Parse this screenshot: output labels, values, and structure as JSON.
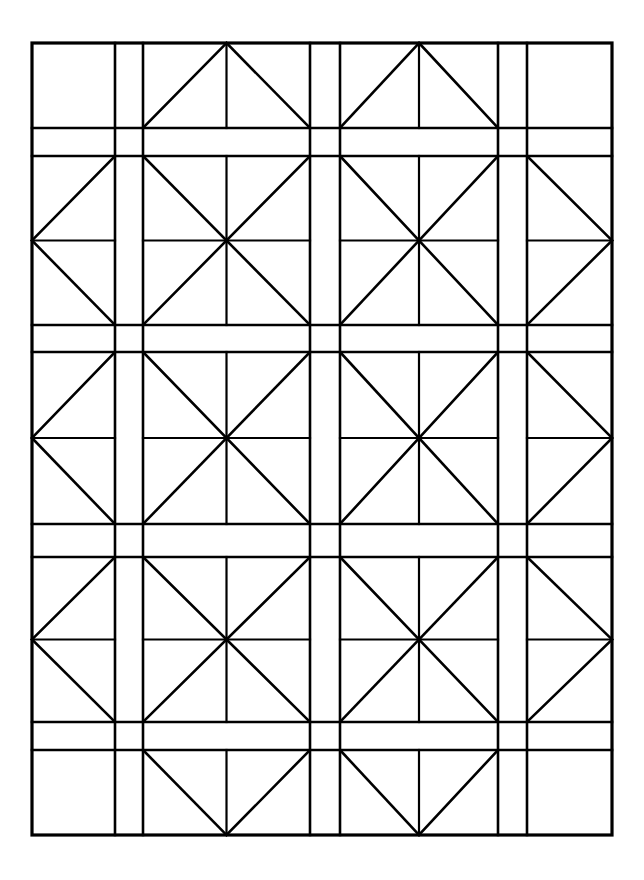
{
  "figure": {
    "background_color": "#ffffff",
    "line_color": "#000000",
    "canvas": {
      "width": 644,
      "height": 880
    }
  },
  "geometry": {
    "border": {
      "x": 32,
      "y": 43,
      "width": 580,
      "height": 792,
      "stroke_width": 3.2
    },
    "column_edges": [
      32,
      115,
      143,
      310,
      340,
      498,
      527,
      612
    ],
    "row_edges": [
      43,
      128,
      156,
      325,
      352,
      524,
      557,
      722,
      750,
      835
    ],
    "column_kinds": [
      "half",
      "sash",
      "block",
      "sash",
      "block",
      "sash",
      "half"
    ],
    "row_kinds": [
      "half",
      "sash",
      "block",
      "sash",
      "block",
      "sash",
      "block",
      "sash",
      "half"
    ],
    "stroke_widths": {
      "border": 3.2,
      "grid": 2.6,
      "diagonal": 2.6,
      "inner": 2.2
    }
  },
  "blocks": {
    "legend": [
      {
        "name": "plain-square",
        "description": "empty corner square with no interior piecing"
      },
      {
        "name": "triangle-up",
        "description": "top edge block: triangle apex at top center, vertical centre line"
      },
      {
        "name": "triangle-down",
        "description": "bottom edge block: triangle apex at bottom centre, vertical centre line"
      },
      {
        "name": "triangle-left",
        "description": "left edge half block: triangle apex at mid-left, horizontal centre line"
      },
      {
        "name": "triangle-right",
        "description": "right edge half block: triangle apex at mid-right, horizontal centre line"
      },
      {
        "name": "pinwheel-star",
        "description": "full block: both diagonals plus vertical and horizontal centre lines forming an eight point star"
      },
      {
        "name": "sashing-strip",
        "description": "narrow plain strip separating the blocks"
      }
    ],
    "grid": [
      [
        "plain-square",
        "sashing-strip",
        "triangle-up",
        "sashing-strip",
        "triangle-up",
        "sashing-strip",
        "plain-square"
      ],
      [
        "sashing-strip",
        "sashing-strip",
        "sashing-strip",
        "sashing-strip",
        "sashing-strip",
        "sashing-strip",
        "sashing-strip"
      ],
      [
        "triangle-left",
        "sashing-strip",
        "pinwheel-star",
        "sashing-strip",
        "pinwheel-star",
        "sashing-strip",
        "triangle-right"
      ],
      [
        "sashing-strip",
        "sashing-strip",
        "sashing-strip",
        "sashing-strip",
        "sashing-strip",
        "sashing-strip",
        "sashing-strip"
      ],
      [
        "triangle-left",
        "sashing-strip",
        "pinwheel-star",
        "sashing-strip",
        "pinwheel-star",
        "sashing-strip",
        "triangle-right"
      ],
      [
        "sashing-strip",
        "sashing-strip",
        "sashing-strip",
        "sashing-strip",
        "sashing-strip",
        "sashing-strip",
        "sashing-strip"
      ],
      [
        "triangle-left",
        "sashing-strip",
        "pinwheel-star",
        "sashing-strip",
        "pinwheel-star",
        "sashing-strip",
        "triangle-right"
      ],
      [
        "sashing-strip",
        "sashing-strip",
        "sashing-strip",
        "sashing-strip",
        "sashing-strip",
        "sashing-strip",
        "sashing-strip"
      ],
      [
        "plain-square",
        "sashing-strip",
        "triangle-down",
        "sashing-strip",
        "triangle-down",
        "sashing-strip",
        "plain-square"
      ]
    ]
  }
}
